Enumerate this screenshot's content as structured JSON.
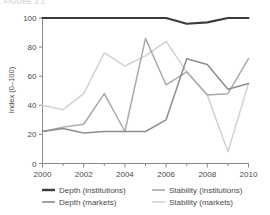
{
  "figure": {
    "title": "FIGURE 2.1",
    "title_visible": false
  },
  "chart_data": {
    "type": "line",
    "title": "",
    "subtitle": "",
    "xlabel": "",
    "ylabel": "Index (0–100)",
    "x": [
      2000,
      2001,
      2002,
      2003,
      2004,
      2005,
      2006,
      2007,
      2008,
      2009,
      2010
    ],
    "xlim": [
      2000,
      2010
    ],
    "ylim": [
      0,
      100
    ],
    "xticks": [
      2000,
      2002,
      2004,
      2006,
      2008,
      2010
    ],
    "xticklabels": [
      "2000",
      "2002",
      "2004",
      "2006",
      "2008",
      "2010"
    ],
    "xminorticks": [
      2001,
      2003,
      2005,
      2007,
      2009
    ],
    "yticks": [
      0,
      20,
      40,
      60,
      80,
      100
    ],
    "yticklabels": [
      "0",
      "20",
      "40",
      "60",
      "80",
      "100"
    ],
    "grid": false,
    "legend_position": "bottom",
    "series": [
      {
        "name": "Depth (institutions)",
        "color": "#3b3b3b",
        "width": 2.1,
        "values": [
          100,
          100,
          100,
          100,
          100,
          100,
          100,
          96,
          97,
          100,
          100
        ]
      },
      {
        "name": "Depth (markets)",
        "color": "#8d8d8d",
        "width": 1.5,
        "values": [
          22,
          24,
          21,
          22,
          22,
          22,
          30,
          72,
          68,
          51,
          55
        ]
      },
      {
        "name": "Stability (institutions)",
        "color": "#aaaaaa",
        "width": 1.5,
        "values": [
          22,
          25,
          27,
          48,
          22,
          86,
          54,
          63,
          47,
          48,
          72
        ]
      },
      {
        "name": "Stability (markets)",
        "color": "#d2d2d2",
        "width": 1.5,
        "values": [
          40,
          37,
          48,
          76,
          67,
          74,
          84,
          63,
          47,
          8,
          55
        ]
      }
    ]
  },
  "legend": {
    "entries": [
      {
        "label": "Depth (institutions)",
        "color": "#3b3b3b",
        "width": 2.4
      },
      {
        "label": "Stability (institutions)",
        "color": "#aaaaaa",
        "width": 1.6
      },
      {
        "label": "Depth (markets)",
        "color": "#8d8d8d",
        "width": 1.6
      },
      {
        "label": "Stability (markets)",
        "color": "#d2d2d2",
        "width": 1.6
      }
    ]
  },
  "axes": {
    "axis_color": "#8a8a8a",
    "text_color": "#4a4a4a"
  }
}
